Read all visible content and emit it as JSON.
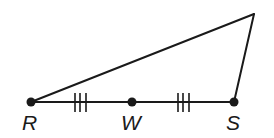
{
  "diagram": {
    "type": "triangle-with-midpoint",
    "points": {
      "R": {
        "label": "R",
        "x": 31,
        "y": 102
      },
      "W": {
        "label": "W",
        "x": 132,
        "y": 102
      },
      "S": {
        "label": "S",
        "x": 234,
        "y": 102
      },
      "apex": {
        "label": "",
        "x": 254,
        "y": 14
      }
    },
    "segments": [
      "R-S",
      "R-apex",
      "S-apex"
    ],
    "congruence_marks": [
      {
        "segment": "R-W",
        "ticks": 3
      },
      {
        "segment": "W-S",
        "ticks": 3
      }
    ],
    "colors": {
      "stroke": "#1a1a1a",
      "background": "#ffffff"
    }
  }
}
